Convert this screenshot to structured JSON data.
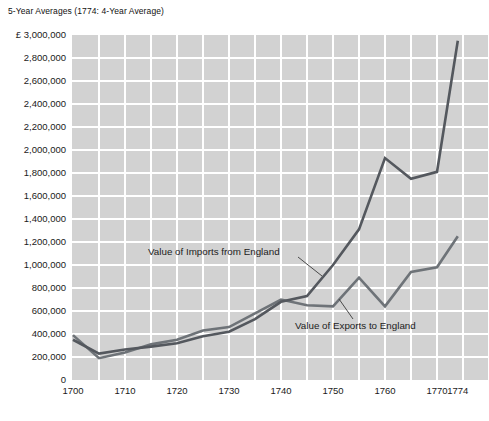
{
  "title": "5-Year Averages (1774: 4-Year Average)",
  "colors": {
    "plot_background": "#d2d2d2",
    "grid_line": "#ffffff",
    "imports_line": "#54585e",
    "exports_line": "#6e7378",
    "leader_line": "#4a4a4a",
    "text": "#1a1a1a"
  },
  "chart_data": {
    "type": "line",
    "title": "5-Year Averages (1774: 4-Year Average)",
    "currency_prefix": "£",
    "x": [
      1700,
      1705,
      1710,
      1715,
      1720,
      1725,
      1730,
      1735,
      1740,
      1745,
      1750,
      1755,
      1760,
      1765,
      1770,
      1774
    ],
    "series": [
      {
        "name": "Value of Imports from England",
        "color": "#54585e",
        "values": [
          350000,
          230000,
          265000,
          290000,
          320000,
          380000,
          420000,
          530000,
          680000,
          730000,
          1000000,
          1310000,
          1930000,
          1750000,
          1810000,
          2950000
        ]
      },
      {
        "name": "Value of Exports to England",
        "color": "#6e7378",
        "values": [
          390000,
          190000,
          240000,
          310000,
          350000,
          430000,
          460000,
          580000,
          700000,
          650000,
          640000,
          890000,
          640000,
          940000,
          980000,
          1250000
        ]
      }
    ],
    "xlabel": "",
    "ylabel": "",
    "xlim": [
      1700,
      1780
    ],
    "ylim": [
      0,
      3000000
    ],
    "grid": "on",
    "legend_position": "inline-annotations",
    "y_ticks": [
      {
        "value": 3000000,
        "label": "£ 3,000,000"
      },
      {
        "value": 2800000,
        "label": "2,800,000"
      },
      {
        "value": 2600000,
        "label": "2,600,000"
      },
      {
        "value": 2400000,
        "label": "2,400,000"
      },
      {
        "value": 2200000,
        "label": "2,200,000"
      },
      {
        "value": 2000000,
        "label": "2,000,000"
      },
      {
        "value": 1800000,
        "label": "1,800,000"
      },
      {
        "value": 1600000,
        "label": "1,600,000"
      },
      {
        "value": 1400000,
        "label": "1,400,000"
      },
      {
        "value": 1200000,
        "label": "1,200,000"
      },
      {
        "value": 1000000,
        "label": "1,000,000"
      },
      {
        "value": 800000,
        "label": "800,000"
      },
      {
        "value": 600000,
        "label": "600,000"
      },
      {
        "value": 400000,
        "label": "400,000"
      },
      {
        "value": 200000,
        "label": "200,000"
      },
      {
        "value": 0,
        "label": "0"
      }
    ],
    "x_ticks": [
      {
        "year": 1700,
        "label": "1700"
      },
      {
        "year": 1710,
        "label": "1710"
      },
      {
        "year": 1720,
        "label": "1720"
      },
      {
        "year": 1730,
        "label": "1730"
      },
      {
        "year": 1740,
        "label": "1740"
      },
      {
        "year": 1750,
        "label": "1750"
      },
      {
        "year": 1760,
        "label": "1760"
      },
      {
        "year": 1770,
        "label": "1770"
      },
      {
        "year": 1774,
        "label": "1774"
      }
    ],
    "annotations": [
      {
        "text": "Value of Imports from England",
        "x": 148,
        "y": 246,
        "leader": [
          298,
          257,
          322,
          276
        ]
      },
      {
        "text": "Value of Exports to England",
        "x": 295,
        "y": 320,
        "leader": [
          339,
          299,
          353,
          319
        ]
      }
    ]
  }
}
